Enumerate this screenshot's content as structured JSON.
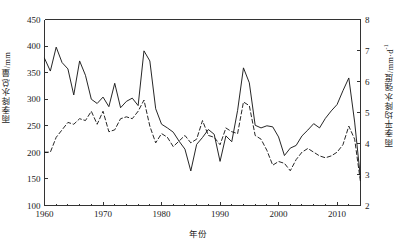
{
  "chart_data": {
    "type": "line",
    "title": "",
    "xlabel": "年份",
    "ylabel": "雨季降水总量/mm",
    "ylabel_right": "雨季平均降水强度/mm·d",
    "ylabel_right_sup": "-1",
    "xlim": [
      1960,
      2014
    ],
    "ylim": [
      100,
      450
    ],
    "ylim_right": [
      2,
      8
    ],
    "xticks": [
      1960,
      1970,
      1980,
      1990,
      2000,
      2010
    ],
    "yticks": [
      100,
      150,
      200,
      250,
      300,
      350,
      400,
      450
    ],
    "yticks_right": [
      2,
      3,
      4,
      5,
      6,
      7,
      8
    ],
    "grid": false,
    "legend": "none",
    "series": [
      {
        "name": "雨季降水总量",
        "axis": "left",
        "style": "solid",
        "color": "#1a1a1a",
        "x": [
          1960,
          1961,
          1962,
          1963,
          1964,
          1965,
          1966,
          1967,
          1968,
          1969,
          1970,
          1971,
          1972,
          1973,
          1974,
          1975,
          1976,
          1977,
          1978,
          1979,
          1980,
          1981,
          1982,
          1983,
          1984,
          1985,
          1986,
          1987,
          1988,
          1989,
          1990,
          1991,
          1992,
          1993,
          1994,
          1995,
          1996,
          1997,
          1998,
          1999,
          2000,
          2001,
          2002,
          2003,
          2004,
          2005,
          2006,
          2007,
          2008,
          2009,
          2010,
          2011,
          2012,
          2013,
          2014
        ],
        "values": [
          377,
          353,
          398,
          369,
          357,
          308,
          372,
          345,
          300,
          292,
          304,
          286,
          330,
          284,
          296,
          302,
          288,
          391,
          372,
          282,
          253,
          246,
          238,
          221,
          206,
          165,
          215,
          228,
          243,
          234,
          183,
          231,
          220,
          279,
          359,
          331,
          251,
          246,
          250,
          248,
          229,
          194,
          208,
          213,
          231,
          242,
          254,
          246,
          264,
          278,
          290,
          316,
          340,
          257,
          151
        ]
      },
      {
        "name": "雨季平均降水强度",
        "axis": "right",
        "style": "dashed",
        "color": "#1a1a1a",
        "x": [
          1960,
          1961,
          1962,
          1963,
          1964,
          1965,
          1966,
          1967,
          1968,
          1969,
          1970,
          1971,
          1972,
          1973,
          1974,
          1975,
          1976,
          1977,
          1978,
          1979,
          1980,
          1981,
          1982,
          1983,
          1984,
          1985,
          1986,
          1987,
          1988,
          1989,
          1990,
          1991,
          1992,
          1993,
          1994,
          1995,
          1996,
          1997,
          1998,
          1999,
          2000,
          2001,
          2002,
          2003,
          2004,
          2005,
          2006,
          2007,
          2008,
          2009,
          2010,
          2011,
          2012,
          2013,
          2014
        ],
        "values": [
          3.72,
          3.72,
          4.2,
          4.44,
          4.68,
          4.62,
          4.8,
          4.74,
          5.04,
          4.62,
          5.04,
          4.38,
          4.44,
          4.8,
          4.86,
          4.8,
          5.04,
          5.4,
          4.56,
          4.02,
          4.32,
          4.2,
          3.9,
          4.08,
          4.26,
          4.02,
          4.14,
          4.74,
          4.26,
          4.2,
          3.96,
          4.5,
          4.38,
          4.32,
          5.34,
          5.22,
          4.26,
          4.14,
          3.78,
          3.3,
          3.42,
          3.36,
          3.12,
          3.48,
          3.72,
          3.84,
          3.72,
          3.6,
          3.54,
          3.6,
          3.72,
          3.96,
          4.56,
          4.14,
          2.76
        ]
      }
    ]
  }
}
